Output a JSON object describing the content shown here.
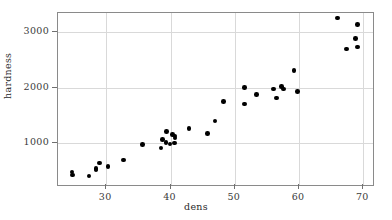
{
  "chart_data": {
    "type": "scatter",
    "title": "",
    "xlabel": "dens",
    "ylabel": "hardness",
    "xlim": [
      22.5,
      71.5
    ],
    "ylim": [
      250,
      3350
    ],
    "xticks": [
      30,
      40,
      50,
      60,
      70
    ],
    "yticks": [
      1000,
      2000,
      3000
    ],
    "grid": true,
    "legend": null,
    "marker": "filled-circle",
    "marker_color": "#000000",
    "points": [
      {
        "x": 24.7,
        "y": 484
      },
      {
        "x": 24.8,
        "y": 427
      },
      {
        "x": 27.3,
        "y": 413
      },
      {
        "x": 28.4,
        "y": 517
      },
      {
        "x": 28.4,
        "y": 549
      },
      {
        "x": 29.0,
        "y": 648
      },
      {
        "x": 30.3,
        "y": 587
      },
      {
        "x": 32.7,
        "y": 704
      },
      {
        "x": 35.6,
        "y": 979
      },
      {
        "x": 38.5,
        "y": 914
      },
      {
        "x": 38.8,
        "y": 1070
      },
      {
        "x": 39.3,
        "y": 1020
      },
      {
        "x": 39.4,
        "y": 1210
      },
      {
        "x": 39.9,
        "y": 989
      },
      {
        "x": 40.3,
        "y": 1160
      },
      {
        "x": 40.6,
        "y": 1010
      },
      {
        "x": 40.7,
        "y": 1100
      },
      {
        "x": 40.7,
        "y": 1130
      },
      {
        "x": 42.9,
        "y": 1270
      },
      {
        "x": 45.8,
        "y": 1180
      },
      {
        "x": 46.9,
        "y": 1400
      },
      {
        "x": 48.2,
        "y": 1760
      },
      {
        "x": 51.5,
        "y": 1710
      },
      {
        "x": 51.5,
        "y": 2010
      },
      {
        "x": 53.4,
        "y": 1880
      },
      {
        "x": 56.0,
        "y": 1980
      },
      {
        "x": 56.5,
        "y": 1820
      },
      {
        "x": 57.3,
        "y": 2020
      },
      {
        "x": 57.6,
        "y": 1980
      },
      {
        "x": 59.2,
        "y": 2310
      },
      {
        "x": 59.8,
        "y": 1940
      },
      {
        "x": 66.0,
        "y": 3260
      },
      {
        "x": 67.4,
        "y": 2700
      },
      {
        "x": 68.8,
        "y": 2890
      },
      {
        "x": 69.1,
        "y": 2740
      },
      {
        "x": 69.1,
        "y": 3140
      }
    ]
  }
}
